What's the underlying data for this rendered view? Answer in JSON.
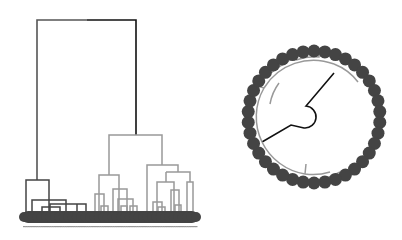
{
  "chart_data": [
    {
      "type": "dendrogram",
      "layout": "rectangular",
      "title": "",
      "leaf_count": 40,
      "leaf_color": "#444444",
      "colors": {
        "root_left": "#555555",
        "root_right": "#111111",
        "cluster_left": "#444444",
        "cluster_right": "#999999"
      },
      "links": [
        {
          "color": "#555555",
          "w": 1.6,
          "d": "M37,180 V20 H87"
        },
        {
          "color": "#111111",
          "w": 1.6,
          "d": "M87,20 H136 V135"
        },
        {
          "color": "#444444",
          "w": 1.5,
          "d": "M26,212 V180 H49 V212"
        },
        {
          "color": "#444444",
          "w": 1.5,
          "d": "M32,212 V200 H66 V212"
        },
        {
          "color": "#444444",
          "w": 1.5,
          "d": "M50,212 V204 H86 V212"
        },
        {
          "color": "#444444",
          "w": 1.5,
          "d": "M42,212 V207 H60 V212"
        },
        {
          "color": "#444444",
          "w": 1.5,
          "d": "M77,212 V204"
        },
        {
          "color": "#999999",
          "w": 1.5,
          "d": "M109,175 V135 H162 V165"
        },
        {
          "color": "#999999",
          "w": 1.5,
          "d": "M99,212 V175 H119 V212"
        },
        {
          "color": "#999999",
          "w": 1.5,
          "d": "M95,212 V194 H104 V212"
        },
        {
          "color": "#999999",
          "w": 1.5,
          "d": "M101,212 V206 H108 V212"
        },
        {
          "color": "#999999",
          "w": 1.5,
          "d": "M113,212 V189 H127 V212"
        },
        {
          "color": "#999999",
          "w": 1.5,
          "d": "M118,212 V199 H133 V212"
        },
        {
          "color": "#999999",
          "w": 1.5,
          "d": "M121,212 V206 H127 V212"
        },
        {
          "color": "#999999",
          "w": 1.5,
          "d": "M130,212 V206 H137 V212"
        },
        {
          "color": "#999999",
          "w": 1.5,
          "d": "M147,212 V165 H178 V172"
        },
        {
          "color": "#999999",
          "w": 1.5,
          "d": "M166,172 H190 V182"
        },
        {
          "color": "#999999",
          "w": 1.5,
          "d": "M157,212 V182 H174 V212"
        },
        {
          "color": "#999999",
          "w": 1.5,
          "d": "M153,212 V202 H162 V212"
        },
        {
          "color": "#999999",
          "w": 1.5,
          "d": "M158,212 V207 H165 V212"
        },
        {
          "color": "#999999",
          "w": 1.5,
          "d": "M171,212 V190 H179 V212"
        },
        {
          "color": "#999999",
          "w": 1.5,
          "d": "M175,212 V205 H181 V212"
        },
        {
          "color": "#999999",
          "w": 1.5,
          "d": "M187,212 V182 H193 V212"
        },
        {
          "color": "#999999",
          "w": 1.5,
          "d": "M166,172 V182"
        }
      ],
      "leaves": {
        "x_start": 24,
        "x_end": 196,
        "y": 217,
        "r": 5
      }
    },
    {
      "type": "dendrogram",
      "layout": "circular",
      "leaf_count": 38,
      "center": [
        314,
        117
      ],
      "leaf_radius": 66,
      "leaf_r": 6.5,
      "leaf_color": "#444444",
      "links": [
        {
          "color": "#111111",
          "w": 1.6,
          "d": "M334,73 L306,106 A10,10 0 1 1 304,128 L291,125 L262,142"
        },
        {
          "color": "#999999",
          "w": 1.5,
          "d": "M262,142 A58,58 0 0 1 264,88 A58,58 0 0 1 334,64"
        },
        {
          "color": "#999999",
          "w": 1.5,
          "d": "M262,142 A58,58 0 0 0 305,174"
        },
        {
          "color": "#999999",
          "w": 1.5,
          "d": "M305,174 L306,164 M305,174 A58,58 0 0 0 330,172"
        },
        {
          "color": "#999999",
          "w": 1.5,
          "d": "M334,64 A55,55 0 0 1 358,82"
        },
        {
          "color": "#999999",
          "w": 1.5,
          "d": "M270,104 A50,50 0 0 1 279,83"
        },
        {
          "color": "#999999",
          "w": 1.5,
          "d": "M264,88 L258,86 M271,73 A60,60 0 0 1 288,62"
        },
        {
          "color": "#999999",
          "w": 1.5,
          "d": "M288,62 L290,58 M296,60 A58,58 0 0 1 319,57 L319,54"
        },
        {
          "color": "#999999",
          "w": 1.5,
          "d": "M276,170 A58,58 0 0 0 300,178 M326,178 A58,58 0 0 0 340,172"
        }
      ]
    }
  ]
}
